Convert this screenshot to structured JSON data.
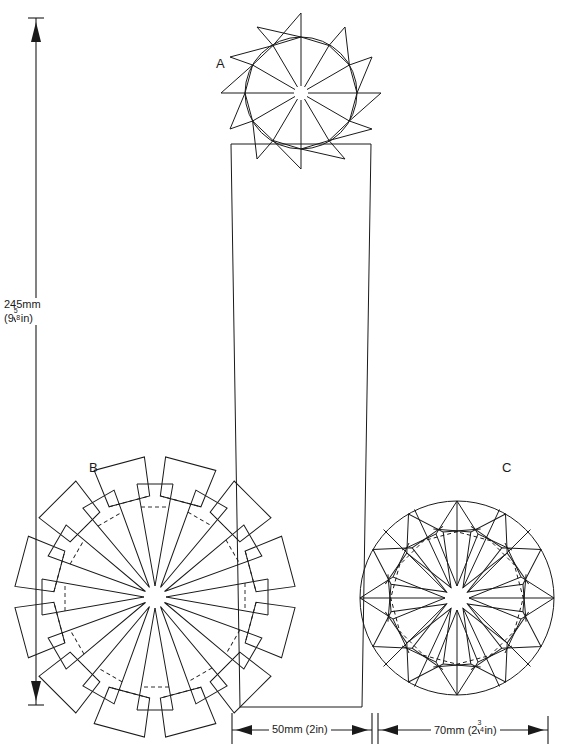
{
  "diagram": {
    "background_color": "#ffffff",
    "line_color": "#1a1a1a",
    "labels": [
      {
        "id": "A",
        "text": "A",
        "x": 216,
        "y": 56
      },
      {
        "id": "B",
        "text": "B",
        "x": 89,
        "y": 460
      },
      {
        "id": "C",
        "text": "C",
        "x": 502,
        "y": 460
      }
    ],
    "vertical_dimension": {
      "name": "overall-height",
      "metric": "245mm",
      "imperial_whole": "(9",
      "imperial_numerator": "5",
      "imperial_denominator": "8",
      "imperial_suffix": "in)",
      "full_text": "245mm (9 5/8 in)",
      "axis_x": 36,
      "top_y": 18,
      "bottom_y": 705
    },
    "horizontal_dimensions": [
      {
        "name": "candle-width",
        "text": "50mm (2in)",
        "metric": "50mm",
        "imperial": "(2in)",
        "left_x": 232,
        "right_x": 372,
        "y": 730
      },
      {
        "name": "star-width",
        "text": "70mm (2 3/4 in)",
        "metric": "70mm",
        "imperial_whole": "(2",
        "imperial_numerator": "3",
        "imperial_denominator": "4",
        "imperial_suffix": "in)",
        "left_x": 378,
        "right_x": 548,
        "y": 730
      }
    ],
    "candle_body": {
      "name": "candle-rectangle",
      "top_left_x": 231,
      "top_right_x": 371,
      "top_y": 144,
      "bottom_left_x": 240,
      "bottom_right_x": 362,
      "bottom_y": 707
    },
    "stars": [
      {
        "id": "A",
        "name": "star-rosette-a",
        "points": 12,
        "center_x": 301,
        "center_y": 93,
        "outer_radius": 80,
        "circle_radius": 56,
        "hub_radius": 7,
        "style": "pointed-triangles-on-circle",
        "has_circle": true,
        "has_fold_lines": false
      },
      {
        "id": "B",
        "name": "star-rosette-b",
        "points": 12,
        "center_x": 155,
        "center_y": 597,
        "outer_radius": 118,
        "circle_radius": 72,
        "hub_radius": 11,
        "style": "tapered-petals-squared-tips",
        "has_circle": false,
        "has_fold_lines": true
      },
      {
        "id": "C",
        "name": "star-rosette-c",
        "points": 12,
        "center_x": 457,
        "center_y": 598,
        "outer_radius": 97,
        "circle_radius": 97,
        "hub_radius": 12,
        "style": "inscribed-folded-petals",
        "has_circle": true,
        "has_fold_lines": true
      }
    ]
  }
}
